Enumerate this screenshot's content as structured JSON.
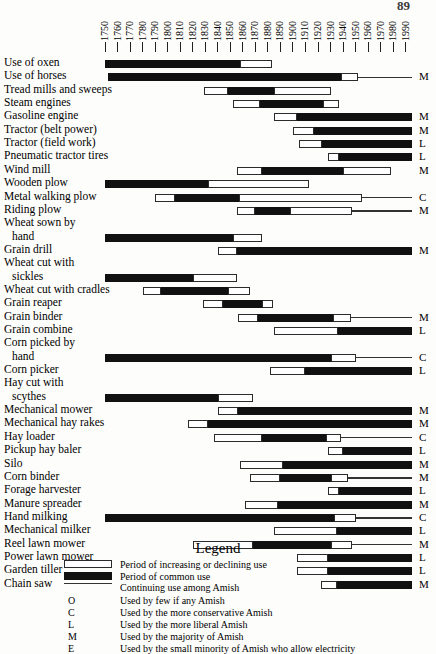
{
  "page": {
    "number": "89"
  },
  "axis": {
    "year_min": 1750,
    "year_max": 1995,
    "ticks": [
      1750,
      1760,
      1770,
      1780,
      1790,
      1800,
      1810,
      1820,
      1830,
      1840,
      1850,
      1860,
      1870,
      1880,
      1890,
      1900,
      1910,
      1920,
      1930,
      1940,
      1950,
      1960,
      1970,
      1980,
      1990
    ],
    "tick_labels": [
      "1750",
      "1760",
      "1770",
      "1780",
      "1790",
      "1800",
      "1810",
      "1820",
      "1830",
      "1840",
      "1850",
      "1860",
      "1870",
      "1880",
      "1890",
      "1900",
      "1910",
      "1920",
      "1930",
      "1940",
      "1950",
      "1960",
      "1970",
      "1980",
      "1990"
    ]
  },
  "legend": {
    "title": "Legend",
    "swatches": [
      {
        "kind": "inc",
        "text": "Period of increasing or declining use"
      },
      {
        "kind": "common",
        "text": "Period of common use"
      },
      {
        "kind": "line",
        "text": "Continuing use among Amish"
      }
    ],
    "codes": [
      {
        "key": "O",
        "text": "Used by few if any Amish"
      },
      {
        "key": "C",
        "text": "Used by the more conservative Amish"
      },
      {
        "key": "L",
        "text": "Used by the more liberal Amish"
      },
      {
        "key": "M",
        "text": "Used by the majority of Amish"
      },
      {
        "key": "E",
        "text": "Used by the small minority of Amish who allow electricity"
      }
    ]
  },
  "chart_data": {
    "type": "bar",
    "title": "",
    "xlabel": "",
    "ylabel": "",
    "xlim": [
      1750,
      1995
    ],
    "grid": false,
    "legend_position": "bottom",
    "categories": [
      "Use of oxen",
      "Use of horses",
      "Tread mills and sweeps",
      "Steam engines",
      "Gasoline engine",
      "Tractor (belt power)",
      "Tractor (field work)",
      "Pneumatic tractor tires",
      "Wind mill",
      "Wooden plow",
      "Metal walking plow",
      "Riding plow",
      "Wheat sown by hand",
      "Grain drill",
      "Wheat cut with sickles",
      "Wheat cut with cradles",
      "Grain reaper",
      "Grain binder",
      "Grain combine",
      "Corn picked by hand",
      "Corn picker",
      "Hay cut with scythes",
      "Mechanical mower",
      "Mechanical hay rakes",
      "Hay loader",
      "Pickup hay baler",
      "Silo",
      "Corn binder",
      "Forage harvester",
      "Manure spreader",
      "Hand milking",
      "Mechanical milker",
      "Reel lawn mower",
      "Power lawn mower",
      "Garden tiller",
      "Chain saw"
    ],
    "rows": [
      {
        "label": "Use of oxen",
        "label2": "",
        "code": "",
        "common": [
          1750,
          1858
        ],
        "inc_after": [
          1858,
          1883
        ],
        "inc_before": [],
        "continuing": null
      },
      {
        "label": "Use of horses",
        "label2": "",
        "code": "M",
        "common": [
          1752,
          1938
        ],
        "inc_after": [
          1938,
          1952
        ],
        "inc_before": [],
        "continuing": 1995
      },
      {
        "label": "Tread mills and sweeps",
        "label2": "",
        "code": "",
        "common": [
          1848,
          1885
        ],
        "inc_after": [
          1885,
          1930
        ],
        "inc_before": [
          1829,
          1848
        ],
        "continuing": null
      },
      {
        "label": "Steam engines",
        "label2": "",
        "code": "",
        "common": [
          1874,
          1924
        ],
        "inc_after": [
          1924,
          1937
        ],
        "inc_before": [
          1852,
          1874
        ],
        "continuing": null
      },
      {
        "label": "Gasoline engine",
        "label2": "",
        "code": "M",
        "common": [
          1903,
          1995
        ],
        "inc_after": [],
        "inc_before": [
          1885,
          1903
        ],
        "continuing": null
      },
      {
        "label": "Tractor (belt power)",
        "label2": "",
        "code": "M",
        "common": [
          1917,
          1995
        ],
        "inc_after": [],
        "inc_before": [
          1900,
          1917
        ],
        "continuing": null
      },
      {
        "label": "Tractor (field work)",
        "label2": "",
        "code": "L",
        "common": [
          1923,
          1995
        ],
        "inc_after": [],
        "inc_before": [
          1905,
          1923
        ],
        "continuing": null
      },
      {
        "label": "Pneumatic tractor tires",
        "label2": "",
        "code": "L",
        "common": [
          1937,
          1995
        ],
        "inc_after": [],
        "inc_before": [
          1928,
          1937
        ],
        "continuing": null
      },
      {
        "label": "Wind mill",
        "label2": "",
        "code": "M",
        "common": [
          1875,
          1940
        ],
        "inc_after": [
          1940,
          1978
        ],
        "inc_before": [
          1855,
          1875
        ],
        "continuing": null
      },
      {
        "label": "Wooden plow",
        "label2": "",
        "code": "",
        "common": [
          1750,
          1832
        ],
        "inc_after": [
          1832,
          1913
        ],
        "inc_before": [],
        "continuing": null
      },
      {
        "label": "Metal walking plow",
        "label2": "",
        "code": "C",
        "common": [
          1806,
          1857
        ],
        "inc_after": [
          1857,
          1955
        ],
        "inc_before": [
          1790,
          1806
        ],
        "continuing": 1995
      },
      {
        "label": "Riding plow",
        "label2": "",
        "code": "M",
        "common": [
          1870,
          1898
        ],
        "inc_after": [
          1898,
          1947
        ],
        "inc_before": [
          1855,
          1870
        ],
        "continuing": 1995
      },
      {
        "label": "Wheat sown by",
        "label2": "hand",
        "code": "",
        "common": [
          1750,
          1852
        ],
        "inc_after": [
          1852,
          1875
        ],
        "inc_before": [],
        "continuing": null
      },
      {
        "label": "Grain drill",
        "label2": "",
        "code": "M",
        "common": [
          1855,
          1995
        ],
        "inc_after": [],
        "inc_before": [
          1840,
          1855
        ],
        "continuing": null
      },
      {
        "label": "Wheat cut with",
        "label2": "sickles",
        "code": "",
        "common": [
          1750,
          1820
        ],
        "inc_after": [
          1820,
          1855
        ],
        "inc_before": [],
        "continuing": null
      },
      {
        "label": "Wheat cut with cradles",
        "label2": "",
        "code": "",
        "common": [
          1795,
          1848
        ],
        "inc_after": [
          1848,
          1866
        ],
        "inc_before": [
          1780,
          1795
        ],
        "continuing": null
      },
      {
        "label": "Grain reaper",
        "label2": "",
        "code": "",
        "common": [
          1844,
          1875
        ],
        "inc_after": [
          1875,
          1884
        ],
        "inc_before": [
          1828,
          1844
        ],
        "continuing": null
      },
      {
        "label": "Grain binder",
        "label2": "",
        "code": "M",
        "common": [
          1872,
          1932
        ],
        "inc_after": [
          1932,
          1946
        ],
        "inc_before": [
          1856,
          1872
        ],
        "continuing": 1995
      },
      {
        "label": "Grain combine",
        "label2": "",
        "code": "L",
        "common": [
          1936,
          1995
        ],
        "inc_after": [],
        "inc_before": [
          1885,
          1936
        ],
        "continuing": null
      },
      {
        "label": "Corn picked by",
        "label2": "hand",
        "code": "C",
        "common": [
          1750,
          1930
        ],
        "inc_after": [
          1930,
          1950
        ],
        "inc_before": [],
        "continuing": 1995
      },
      {
        "label": "Corn picker",
        "label2": "",
        "code": "L",
        "common": [
          1910,
          1995
        ],
        "inc_after": [],
        "inc_before": [
          1882,
          1910
        ],
        "continuing": null
      },
      {
        "label": "Hay cut with",
        "label2": "scythes",
        "code": "",
        "common": [
          1750,
          1840
        ],
        "inc_after": [
          1840,
          1868
        ],
        "inc_before": [],
        "continuing": null
      },
      {
        "label": "Mechanical mower",
        "label2": "",
        "code": "M",
        "common": [
          1856,
          1995
        ],
        "inc_after": [],
        "inc_before": [
          1840,
          1856
        ],
        "continuing": null
      },
      {
        "label": "Mechanical hay rakes",
        "label2": "",
        "code": "M",
        "common": [
          1832,
          1995
        ],
        "inc_after": [],
        "inc_before": [
          1816,
          1832
        ],
        "continuing": null
      },
      {
        "label": "Hay loader",
        "label2": "",
        "code": "C",
        "common": [
          1875,
          1926
        ],
        "inc_after": [
          1926,
          1938
        ],
        "inc_before": [
          1837,
          1875
        ],
        "continuing": 1995
      },
      {
        "label": "Pickup hay baler",
        "label2": "",
        "code": "L",
        "common": [
          1940,
          1995
        ],
        "inc_after": [],
        "inc_before": [
          1928,
          1940
        ],
        "continuing": null
      },
      {
        "label": "Silo",
        "label2": "",
        "code": "M",
        "common": [
          1892,
          1995
        ],
        "inc_after": [],
        "inc_before": [
          1858,
          1892
        ],
        "continuing": null
      },
      {
        "label": "Corn binder",
        "label2": "",
        "code": "M",
        "common": [
          1890,
          1930
        ],
        "inc_after": [
          1930,
          1944
        ],
        "inc_before": [
          1866,
          1890
        ],
        "continuing": 1995
      },
      {
        "label": "Forage harvester",
        "label2": "",
        "code": "L",
        "common": [
          1937,
          1995
        ],
        "inc_after": [],
        "inc_before": [
          1928,
          1937
        ],
        "continuing": null
      },
      {
        "label": "Manure spreader",
        "label2": "",
        "code": "M",
        "common": [
          1888,
          1995
        ],
        "inc_after": [],
        "inc_before": [
          1862,
          1888
        ],
        "continuing": null
      },
      {
        "label": "Hand milking",
        "label2": "",
        "code": "C",
        "common": [
          1750,
          1933
        ],
        "inc_after": [
          1933,
          1950
        ],
        "inc_before": [],
        "continuing": 1995
      },
      {
        "label": "Mechanical milker",
        "label2": "",
        "code": "L",
        "common": [
          1935,
          1995
        ],
        "inc_after": [],
        "inc_before": [
          1885,
          1935
        ],
        "continuing": null
      },
      {
        "label": "Reel lawn mower",
        "label2": "",
        "code": "M",
        "common": [
          1868,
          1930
        ],
        "inc_after": [
          1930,
          1947
        ],
        "inc_before": [
          1820,
          1868
        ],
        "continuing": 1995
      },
      {
        "label": "Power lawn mower",
        "label2": "",
        "code": "L",
        "common": [
          1928,
          1995
        ],
        "inc_after": [],
        "inc_before": [
          1903,
          1928
        ],
        "continuing": null
      },
      {
        "label": "Garden tiller",
        "label2": "",
        "code": "L",
        "common": [
          1928,
          1995
        ],
        "inc_after": [],
        "inc_before": [
          1903,
          1928
        ],
        "continuing": null
      },
      {
        "label": "Chain saw",
        "label2": "",
        "code": "M",
        "common": [
          1935,
          1995
        ],
        "inc_after": [],
        "inc_before": [
          1922,
          1935
        ],
        "continuing": null
      }
    ]
  }
}
